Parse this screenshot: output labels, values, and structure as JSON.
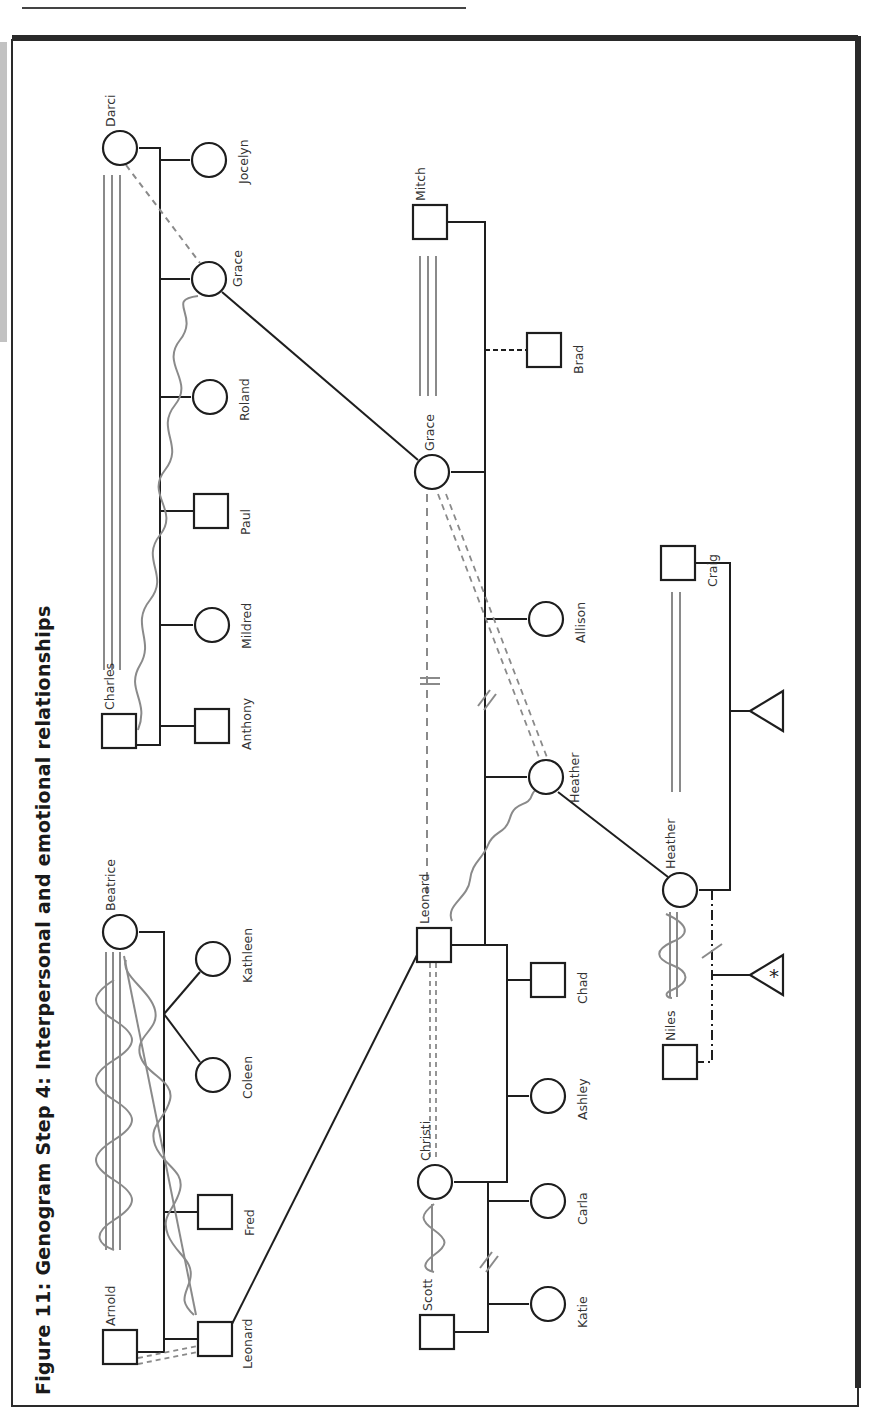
{
  "figure": {
    "title": "Figure 11: Genogram Step 4: Interpersonal and emotional relationships",
    "orientation": "rotated-90-ccw"
  },
  "colors": {
    "structure": "#1e1e1e",
    "relationship": "#8a8a8a",
    "frame": "#2a2a2a",
    "page": "#ffffff"
  },
  "legend_semantics": {
    "circle": "female",
    "square": "male",
    "triangle": "pregnancy / unknown gender",
    "triangle_asterisk": "pregnancy (marked)",
    "triple_line": "fused / very close",
    "double_line": "close",
    "dashed_line": "distant",
    "double_dashed_line": "close-distant / ambivalent",
    "zigzag_wave": "conflict / hostile",
    "slash_slash": "divorce",
    "single_slash": "separation",
    "dash_dot_line": "cohabitation"
  },
  "people": [
    {
      "id": "darci",
      "name": "Darci",
      "sex": "female",
      "x": 120,
      "y": 148
    },
    {
      "id": "jocelyn",
      "name": "Jocelyn",
      "sex": "female",
      "x": 209,
      "y": 160
    },
    {
      "id": "grace1",
      "name": "Grace",
      "sex": "female",
      "x": 209,
      "y": 279
    },
    {
      "id": "roland",
      "name": "Roland",
      "sex": "female",
      "x": 210,
      "y": 397
    },
    {
      "id": "paul",
      "name": "Paul",
      "sex": "male",
      "x": 211,
      "y": 511
    },
    {
      "id": "mildred",
      "name": "Mildred",
      "sex": "female",
      "x": 212,
      "y": 625
    },
    {
      "id": "charles",
      "name": "Charles",
      "sex": "male",
      "x": 119,
      "y": 731
    },
    {
      "id": "anthony",
      "name": "Anthony",
      "sex": "male",
      "x": 212,
      "y": 726
    },
    {
      "id": "beatrice",
      "name": "Beatrice",
      "sex": "female",
      "x": 120,
      "y": 932
    },
    {
      "id": "kathleen",
      "name": "Kathleen",
      "sex": "female",
      "x": 213,
      "y": 959
    },
    {
      "id": "coleen",
      "name": "Coleen",
      "sex": "female",
      "x": 213,
      "y": 1075
    },
    {
      "id": "fred",
      "name": "Fred",
      "sex": "male",
      "x": 215,
      "y": 1212
    },
    {
      "id": "arnold",
      "name": "Arnold",
      "sex": "male",
      "x": 120,
      "y": 1347
    },
    {
      "id": "leonard1",
      "name": "Leonard",
      "sex": "male",
      "x": 215,
      "y": 1339
    },
    {
      "id": "mitch",
      "name": "Mitch",
      "sex": "male",
      "x": 430,
      "y": 222
    },
    {
      "id": "brad",
      "name": "Brad",
      "sex": "male",
      "x": 544,
      "y": 350
    },
    {
      "id": "grace2",
      "name": "Grace",
      "sex": "female",
      "x": 432,
      "y": 472
    },
    {
      "id": "allison",
      "name": "Allison",
      "sex": "female",
      "x": 546,
      "y": 619
    },
    {
      "id": "heather1",
      "name": "Heather",
      "sex": "female",
      "x": 546,
      "y": 777
    },
    {
      "id": "leonard2",
      "name": "Leonard",
      "sex": "male",
      "x": 434,
      "y": 945
    },
    {
      "id": "chad",
      "name": "Chad",
      "sex": "male",
      "x": 548,
      "y": 980
    },
    {
      "id": "ashley",
      "name": "Ashley",
      "sex": "female",
      "x": 548,
      "y": 1096
    },
    {
      "id": "christi",
      "name": "Christi",
      "sex": "female",
      "x": 435,
      "y": 1182
    },
    {
      "id": "carla",
      "name": "Carla",
      "sex": "female",
      "x": 548,
      "y": 1201
    },
    {
      "id": "scott",
      "name": "Scott",
      "sex": "male",
      "x": 437,
      "y": 1332
    },
    {
      "id": "katie",
      "name": "Katie",
      "sex": "female",
      "x": 548,
      "y": 1304
    },
    {
      "id": "craig",
      "name": "Craig",
      "sex": "male",
      "x": 678,
      "y": 563
    },
    {
      "id": "heather2",
      "name": "Heather",
      "sex": "female",
      "x": 680,
      "y": 890
    },
    {
      "id": "niles",
      "name": "Niles",
      "sex": "male",
      "x": 680,
      "y": 1062
    }
  ],
  "pregnancies": [
    {
      "id": "preg1",
      "x": 773,
      "y": 711,
      "marked": false
    },
    {
      "id": "preg2",
      "x": 773,
      "y": 975,
      "marked": true,
      "mark": "*"
    }
  ],
  "relationships": [
    {
      "from": "darci",
      "to": "charles",
      "type": "fused"
    },
    {
      "from": "darci",
      "to": "grace1",
      "type": "distant"
    },
    {
      "from": "charles",
      "to": "grace1",
      "type": "conflict"
    },
    {
      "from": "beatrice",
      "to": "arnold",
      "type": "fused-conflict"
    },
    {
      "from": "beatrice",
      "to": "leonard1",
      "type": "close-conflict"
    },
    {
      "from": "arnold",
      "to": "leonard1",
      "type": "ambivalent-dashed"
    },
    {
      "from": "mitch",
      "to": "grace2",
      "type": "fused"
    },
    {
      "from": "grace2",
      "to": "leonard2",
      "type": "distant-cutoff"
    },
    {
      "from": "grace2",
      "to": "heather1",
      "type": "ambivalent-dashed"
    },
    {
      "from": "leonard2",
      "to": "heather1",
      "type": "conflict"
    },
    {
      "from": "leonard2",
      "to": "christi",
      "type": "ambivalent-dashed"
    },
    {
      "from": "christi",
      "to": "scott",
      "type": "close-conflict"
    },
    {
      "from": "craig",
      "to": "heather2",
      "type": "close"
    },
    {
      "from": "heather2",
      "to": "niles",
      "type": "close-conflict"
    }
  ],
  "identity_links": [
    {
      "from": "grace1",
      "to": "grace2"
    },
    {
      "from": "leonard1",
      "to": "leonard2"
    },
    {
      "from": "heather1",
      "to": "heather2"
    }
  ]
}
